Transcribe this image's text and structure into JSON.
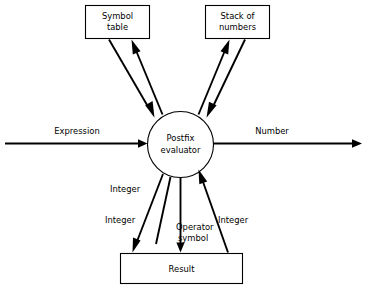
{
  "diagram": {
    "background_color": "#ffffff",
    "line_color": "#000000",
    "nodes": [
      {
        "id": "symbol-table",
        "shape": "box",
        "label_line1": "Symbol",
        "label_line2": "table"
      },
      {
        "id": "stack-of-numbers",
        "shape": "box",
        "label_line1": "Stack of",
        "label_line2": "numbers"
      },
      {
        "id": "postfix-evaluator",
        "shape": "circle",
        "label_line1": "Postfix",
        "label_line2": "evaluator"
      },
      {
        "id": "result",
        "shape": "box",
        "label_line1": "Result",
        "label_line2": ""
      }
    ],
    "edge_labels": {
      "expression": "Expression",
      "number": "Number",
      "integer_upper_left": "Integer",
      "integer_lower_left": "Integer",
      "operator_symbol_line1": "Operator",
      "operator_symbol_line2": "symbol",
      "integer_right": "Integer"
    }
  }
}
